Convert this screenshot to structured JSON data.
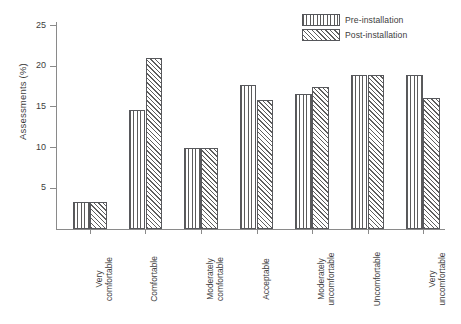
{
  "chart_data": {
    "type": "bar",
    "title": "",
    "xlabel": "",
    "ylabel": "Assessments (%)",
    "ylim": [
      0,
      25
    ],
    "yticks": [
      5,
      10,
      15,
      20,
      25
    ],
    "grid": false,
    "legend_position": "top-right",
    "categories": [
      "Very\ncomfortable",
      "Comfortable",
      "Moderately\ncomfortable",
      "Acceptable",
      "Moderately\nuncomfortable",
      "Uncomfortable",
      "Very\nuncomfortable"
    ],
    "series": [
      {
        "name": "Pre-installation",
        "pattern": "vertical-stripes",
        "values": [
          3.3,
          14.6,
          10.0,
          17.7,
          16.6,
          18.9,
          18.9
        ]
      },
      {
        "name": "Post-installation",
        "pattern": "diagonal-hatch",
        "values": [
          3.3,
          21.0,
          10.0,
          15.8,
          17.4,
          18.9,
          16.1
        ]
      }
    ]
  },
  "legend": {
    "items": [
      {
        "label": "Pre-installation"
      },
      {
        "label": "Post-installation"
      }
    ]
  },
  "axes": {
    "y_title": "Assessments (%)",
    "y_ticks": [
      "5",
      "10",
      "15",
      "20",
      "25"
    ]
  },
  "colors": {
    "axis": "#8a8a8a",
    "text": "#3d3d3d",
    "bar_outline": "#57585c",
    "hatch": "#5b5b5b",
    "background": "#ffffff"
  }
}
